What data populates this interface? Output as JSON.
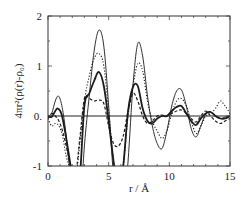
{
  "chart_data": {
    "type": "line",
    "title": "",
    "xlabel": "r  /  Å",
    "ylabel": "4πr²(ρ(r)-ρ₀)",
    "xlim": [
      0,
      15
    ],
    "ylim": [
      -1,
      2
    ],
    "xticks": [
      0,
      5,
      10,
      15
    ],
    "xtick_labels": [
      "0",
      "5",
      "10",
      "15"
    ],
    "yticks": [
      -1,
      0,
      1,
      2
    ],
    "ytick_labels": [
      "-1",
      "0.",
      "1",
      "2"
    ],
    "zero_line": true,
    "grid": false,
    "legend": null,
    "series": [
      {
        "name": "thin-solid",
        "style": "solid-thin",
        "x": [
          0,
          0.3,
          0.6,
          0.85,
          1.1,
          1.4,
          1.8,
          2.2,
          2.6,
          3.0,
          3.4,
          3.8,
          4.2,
          4.6,
          5.0,
          5.4,
          5.8,
          6.2,
          6.6,
          7.0,
          7.4,
          7.8,
          8.2,
          8.6,
          9.0,
          9.4,
          9.8,
          10.2,
          10.6,
          11.0,
          11.4,
          11.8,
          12.2,
          12.6,
          13.0,
          13.4,
          13.8,
          14.2,
          14.6,
          15.0
        ],
        "y": [
          0.0,
          0.05,
          0.3,
          0.4,
          0.25,
          -0.2,
          -1.1,
          -2.0,
          -2.0,
          -0.6,
          0.4,
          1.3,
          1.72,
          1.4,
          0.2,
          -1.2,
          -2.0,
          -2.0,
          -0.9,
          0.6,
          1.45,
          1.2,
          0.4,
          -0.2,
          -0.55,
          -0.65,
          -0.3,
          0.2,
          0.5,
          0.52,
          0.2,
          -0.25,
          -0.42,
          -0.2,
          0.05,
          0.08,
          0.0,
          -0.05,
          -0.02,
          0.0
        ]
      },
      {
        "name": "dotted",
        "style": "dotted",
        "x": [
          0,
          0.3,
          0.6,
          0.9,
          1.2,
          1.5,
          1.9,
          2.3,
          2.6,
          3.0,
          3.4,
          3.8,
          4.2,
          4.6,
          5.0,
          5.4,
          5.8,
          6.2,
          6.6,
          7.0,
          7.4,
          7.8,
          8.2,
          8.6,
          9.0,
          9.4,
          9.8,
          10.2,
          10.6,
          11.0,
          11.4,
          11.8,
          12.2,
          12.6,
          13.0,
          13.4,
          13.8,
          14.2,
          14.6,
          15.0
        ],
        "y": [
          -0.05,
          -0.2,
          -0.15,
          -0.2,
          -0.4,
          -0.8,
          -1.1,
          -1.2,
          -0.6,
          0.3,
          0.8,
          1.15,
          1.25,
          1.0,
          0.1,
          -0.9,
          -1.4,
          -1.0,
          0.0,
          0.6,
          1.05,
          0.9,
          0.3,
          -0.1,
          -0.3,
          -0.45,
          -0.3,
          0.05,
          0.3,
          0.35,
          0.2,
          -0.1,
          -0.35,
          -0.2,
          0.0,
          0.05,
          0.15,
          0.3,
          0.2,
          0.05
        ]
      },
      {
        "name": "thick-solid",
        "style": "solid-thick",
        "x": [
          0,
          0.3,
          0.6,
          0.8,
          1.1,
          1.4,
          1.8,
          2.2,
          2.6,
          3.0,
          3.4,
          3.8,
          4.2,
          4.6,
          5.0,
          5.4,
          5.8,
          6.2,
          6.6,
          7.0,
          7.4,
          7.8,
          8.2,
          8.6,
          9.0,
          9.4,
          9.8,
          10.2,
          10.6,
          11.0,
          11.4,
          11.8,
          12.2,
          12.6,
          13.0,
          13.4,
          13.8,
          14.2,
          14.6,
          15.0
        ],
        "y": [
          0.0,
          -0.02,
          0.1,
          0.15,
          0.05,
          -0.3,
          -0.9,
          -1.5,
          -1.3,
          0.2,
          0.45,
          0.7,
          0.88,
          0.6,
          -0.1,
          -0.9,
          -1.5,
          -1.0,
          0.1,
          0.58,
          0.6,
          0.15,
          -0.1,
          -0.15,
          -0.05,
          0.0,
          0.0,
          0.1,
          0.18,
          0.2,
          0.05,
          -0.1,
          -0.18,
          -0.05,
          0.05,
          0.08,
          0.0,
          -0.05,
          -0.05,
          0.0
        ]
      },
      {
        "name": "dashed",
        "style": "dashed",
        "x": [
          0,
          0.3,
          0.6,
          0.9,
          1.2,
          1.5,
          1.9,
          2.3,
          2.6,
          3.0,
          3.4,
          3.8,
          4.2,
          4.6,
          5.0,
          5.4,
          5.8,
          6.2,
          6.6,
          7.0,
          7.4,
          7.8,
          8.2,
          8.6,
          9.0,
          9.4,
          9.8,
          10.2,
          10.6,
          11.0,
          11.4,
          11.8,
          12.2,
          12.6,
          13.0,
          13.4,
          13.8,
          14.2,
          14.6,
          15.0
        ],
        "y": [
          -0.05,
          0.05,
          0.0,
          -0.1,
          -0.3,
          -0.6,
          -1.0,
          -1.1,
          -0.5,
          0.35,
          0.35,
          0.3,
          0.32,
          0.25,
          -0.2,
          -0.55,
          -0.6,
          -0.4,
          0.1,
          0.45,
          0.3,
          0.0,
          -0.15,
          -0.1,
          0.0,
          0.02,
          0.0,
          0.05,
          0.1,
          0.12,
          0.05,
          -0.05,
          -0.12,
          0.0,
          0.1,
          0.0,
          -0.1,
          -0.15,
          -0.1,
          -0.05
        ]
      }
    ]
  }
}
